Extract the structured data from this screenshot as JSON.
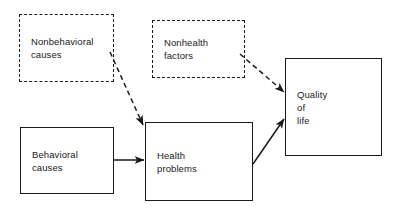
{
  "diagram": {
    "stroke_color": "#1a1a1a",
    "background_color": "#ffffff",
    "nodes": [
      {
        "id": "nonbehavioral-causes",
        "label": "Nonbehavioral\ncauses",
        "border_style": "dashed",
        "x": 19,
        "y": 14,
        "width": 95,
        "height": 68
      },
      {
        "id": "nonhealth-factors",
        "label": "Nonhealth\nfactors",
        "border_style": "dashed",
        "x": 152,
        "y": 20,
        "width": 93,
        "height": 58
      },
      {
        "id": "behavioral-causes",
        "label": "Behavioral\ncauses",
        "border_style": "solid",
        "x": 20,
        "y": 127,
        "width": 94,
        "height": 67
      },
      {
        "id": "health-problems",
        "label": "Health\nproblems",
        "border_style": "solid",
        "x": 145,
        "y": 122,
        "width": 108,
        "height": 79
      },
      {
        "id": "quality-of-life",
        "label": "Quality\nof\nlife",
        "border_style": "solid",
        "x": 285,
        "y": 58,
        "width": 97,
        "height": 98
      }
    ],
    "edges": [
      {
        "id": "nonbehavioral-to-health",
        "from": "nonbehavioral-causes",
        "to": "health-problems",
        "line_style": "dashed",
        "x1": 110,
        "y1": 52,
        "x2": 143,
        "y2": 125
      },
      {
        "id": "nonhealth-to-quality",
        "from": "nonhealth-factors",
        "to": "quality-of-life",
        "line_style": "dashed",
        "x1": 240,
        "y1": 54,
        "x2": 284,
        "y2": 92
      },
      {
        "id": "behavioral-to-health",
        "from": "behavioral-causes",
        "to": "health-problems",
        "line_style": "solid",
        "x1": 114,
        "y1": 160,
        "x2": 144,
        "y2": 160
      },
      {
        "id": "health-to-quality",
        "from": "health-problems",
        "to": "quality-of-life",
        "line_style": "solid",
        "x1": 253,
        "y1": 164,
        "x2": 284,
        "y2": 119
      }
    ]
  }
}
